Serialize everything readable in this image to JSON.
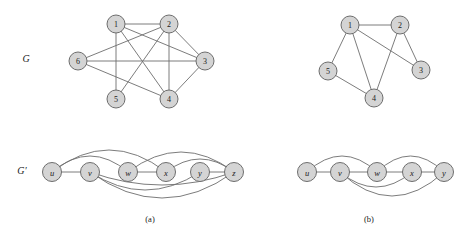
{
  "figure": {
    "row_labels": [
      {
        "id": "G",
        "text": "G",
        "x": 26,
        "y": 58
      },
      {
        "id": "G-prime",
        "text": "G′",
        "x": 22,
        "y": 170
      }
    ],
    "sub_captions": [
      {
        "id": "a",
        "text": "(a)",
        "x": 150,
        "y": 219
      },
      {
        "id": "b",
        "text": "(b)",
        "x": 369,
        "y": 219
      }
    ],
    "panels": [
      {
        "id": "a",
        "graph_G": {
          "radius": 9,
          "nodes": [
            {
              "id": "1",
              "label": "1",
              "x": 116,
              "y": 24
            },
            {
              "id": "2",
              "label": "2",
              "x": 169,
              "y": 24
            },
            {
              "id": "3",
              "label": "3",
              "x": 205,
              "y": 61
            },
            {
              "id": "4",
              "label": "4",
              "x": 169,
              "y": 99
            },
            {
              "id": "5",
              "label": "5",
              "x": 116,
              "y": 99
            },
            {
              "id": "6",
              "label": "6",
              "x": 78,
              "y": 61
            }
          ],
          "edges": [
            [
              "1",
              "2"
            ],
            [
              "1",
              "3"
            ],
            [
              "1",
              "4"
            ],
            [
              "1",
              "5"
            ],
            [
              "2",
              "6"
            ],
            [
              "2",
              "4"
            ],
            [
              "2",
              "5"
            ],
            [
              "2",
              "3"
            ],
            [
              "3",
              "6"
            ],
            [
              "3",
              "4"
            ],
            [
              "6",
              "4"
            ]
          ]
        },
        "graph_Gprime": {
          "radius": 9.5,
          "nodes": [
            {
              "id": "u",
              "label": "u",
              "x": 52,
              "y": 172
            },
            {
              "id": "v",
              "label": "v",
              "x": 90,
              "y": 172
            },
            {
              "id": "w",
              "label": "w",
              "x": 128,
              "y": 172
            },
            {
              "id": "x",
              "label": "x",
              "x": 166,
              "y": 172
            },
            {
              "id": "y",
              "label": "y",
              "x": 200,
              "y": 172
            },
            {
              "id": "z",
              "label": "z",
              "x": 234,
              "y": 172
            }
          ],
          "chain_edges": [
            [
              "u",
              "v"
            ],
            [
              "w",
              "x"
            ],
            [
              "y",
              "z"
            ]
          ],
          "arc_edges": [
            {
              "from": "u",
              "to": "w",
              "side": "above",
              "bow": 16
            },
            {
              "from": "u",
              "to": "x",
              "side": "above",
              "bow": 22
            },
            {
              "from": "w",
              "to": "z",
              "side": "above",
              "bow": 20
            },
            {
              "from": "x",
              "to": "z",
              "side": "above",
              "bow": 13
            },
            {
              "from": "v",
              "to": "y",
              "side": "below",
              "bow": 18
            },
            {
              "from": "v",
              "to": "z",
              "side": "below",
              "bow": 26
            },
            {
              "from": "v",
              "to": "z",
              "side": "below",
              "bow": 13
            }
          ]
        }
      },
      {
        "id": "b",
        "graph_G": {
          "radius": 9,
          "nodes": [
            {
              "id": "1",
              "label": "1",
              "x": 350,
              "y": 25
            },
            {
              "id": "2",
              "label": "2",
              "x": 400,
              "y": 25
            },
            {
              "id": "3",
              "label": "3",
              "x": 421,
              "y": 70
            },
            {
              "id": "4",
              "label": "4",
              "x": 374,
              "y": 98
            },
            {
              "id": "5",
              "label": "5",
              "x": 328,
              "y": 71
            }
          ],
          "edges": [
            [
              "1",
              "2"
            ],
            [
              "1",
              "3"
            ],
            [
              "1",
              "4"
            ],
            [
              "1",
              "5"
            ],
            [
              "2",
              "3"
            ],
            [
              "2",
              "4"
            ],
            [
              "5",
              "4"
            ]
          ]
        },
        "graph_Gprime": {
          "radius": 9.5,
          "nodes": [
            {
              "id": "u",
              "label": "u",
              "x": 307,
              "y": 172
            },
            {
              "id": "v",
              "label": "v",
              "x": 340,
              "y": 172
            },
            {
              "id": "w",
              "label": "w",
              "x": 377,
              "y": 172
            },
            {
              "id": "x",
              "label": "x",
              "x": 412,
              "y": 172
            },
            {
              "id": "y",
              "label": "y",
              "x": 444,
              "y": 172
            }
          ],
          "chain_edges": [
            [
              "u",
              "v"
            ],
            [
              "v",
              "w"
            ],
            [
              "w",
              "x"
            ],
            [
              "x",
              "y"
            ]
          ],
          "arc_edges": [
            {
              "from": "u",
              "to": "w",
              "side": "above",
              "bow": 16
            },
            {
              "from": "w",
              "to": "y",
              "side": "above",
              "bow": 16
            },
            {
              "from": "v",
              "to": "x",
              "side": "below",
              "bow": 15
            },
            {
              "from": "v",
              "to": "y",
              "side": "below",
              "bow": 24
            }
          ]
        }
      }
    ]
  },
  "colors": {
    "node_fill": "#d4d4d4",
    "node_stroke": "#6d6d6d",
    "edge_stroke": "#6d6d6d",
    "text": "#1a1a1a",
    "background": "#ffffff"
  }
}
